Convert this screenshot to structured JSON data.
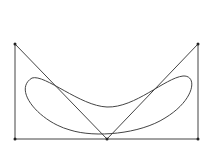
{
  "diagram": {
    "points": [
      {
        "name": "top-left",
        "x": 15,
        "y": 44
      },
      {
        "name": "top-right",
        "x": 198,
        "y": 44
      },
      {
        "name": "bottom-left",
        "x": 15,
        "y": 139
      },
      {
        "name": "bottom-mid",
        "x": 107,
        "y": 139
      },
      {
        "name": "bottom-right",
        "x": 198,
        "y": 139
      }
    ],
    "stroke_color": "#444444",
    "point_color": "#222222"
  }
}
